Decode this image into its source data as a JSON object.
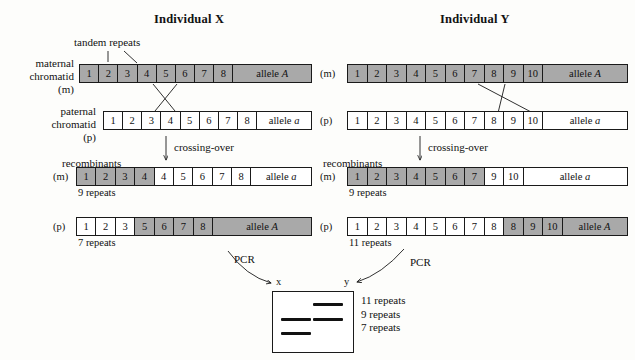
{
  "panels": [
    {
      "title": "Individual X",
      "annotations": {
        "tandem_repeats": "tandem repeats",
        "crossing_over": "crossing-over",
        "recombinants": "recombinants"
      },
      "maternal": {
        "label_lines": [
          "maternal",
          "chromatid",
          "(m)"
        ],
        "cells": [
          {
            "text": "1",
            "shaded": true
          },
          {
            "text": "2",
            "shaded": true
          },
          {
            "text": "3",
            "shaded": true
          },
          {
            "text": "4",
            "shaded": true
          },
          {
            "text": "5",
            "shaded": true
          },
          {
            "text": "6",
            "shaded": true
          },
          {
            "text": "7",
            "shaded": true
          },
          {
            "text": "8",
            "shaded": true
          }
        ],
        "allele": "allele A",
        "allele_symbol": "A",
        "allele_shaded": true
      },
      "paternal": {
        "label_lines": [
          "paternal",
          "chromatid",
          "(p)"
        ],
        "cells": [
          {
            "text": "1",
            "shaded": false
          },
          {
            "text": "2",
            "shaded": false
          },
          {
            "text": "3",
            "shaded": false
          },
          {
            "text": "4",
            "shaded": false
          },
          {
            "text": "5",
            "shaded": false
          },
          {
            "text": "6",
            "shaded": false
          },
          {
            "text": "7",
            "shaded": false
          },
          {
            "text": "8",
            "shaded": false
          }
        ],
        "allele": "allele a",
        "allele_symbol": "a",
        "allele_shaded": false
      },
      "recombinant_m": {
        "label": "(m)",
        "cells": [
          {
            "text": "1",
            "shaded": true
          },
          {
            "text": "2",
            "shaded": true
          },
          {
            "text": "3",
            "shaded": true
          },
          {
            "text": "4",
            "shaded": true
          },
          {
            "text": "4",
            "shaded": false
          },
          {
            "text": "5",
            "shaded": false
          },
          {
            "text": "6",
            "shaded": false
          },
          {
            "text": "7",
            "shaded": false
          },
          {
            "text": "8",
            "shaded": false
          }
        ],
        "allele": "allele a",
        "allele_symbol": "a",
        "allele_shaded": false,
        "repeats": "9 repeats"
      },
      "recombinant_p": {
        "label": "(p)",
        "cells": [
          {
            "text": "1",
            "shaded": false
          },
          {
            "text": "2",
            "shaded": false
          },
          {
            "text": "3",
            "shaded": false
          },
          {
            "text": "5",
            "shaded": true
          },
          {
            "text": "6",
            "shaded": true
          },
          {
            "text": "7",
            "shaded": true
          },
          {
            "text": "8",
            "shaded": true
          }
        ],
        "allele": "allele A",
        "allele_symbol": "A",
        "allele_shaded": true,
        "repeats": "7 repeats"
      }
    },
    {
      "title": "Individual Y",
      "annotations": {
        "crossing_over": "crossing-over",
        "recombinants": "recombinants"
      },
      "maternal": {
        "label_lines": [
          "(m)"
        ],
        "cells": [
          {
            "text": "1",
            "shaded": true
          },
          {
            "text": "2",
            "shaded": true
          },
          {
            "text": "3",
            "shaded": true
          },
          {
            "text": "4",
            "shaded": true
          },
          {
            "text": "5",
            "shaded": true
          },
          {
            "text": "6",
            "shaded": true
          },
          {
            "text": "7",
            "shaded": true
          },
          {
            "text": "8",
            "shaded": true
          },
          {
            "text": "9",
            "shaded": true
          },
          {
            "text": "10",
            "shaded": true
          }
        ],
        "allele": "allele A",
        "allele_symbol": "A",
        "allele_shaded": true
      },
      "paternal": {
        "label_lines": [
          "(p)"
        ],
        "cells": [
          {
            "text": "1",
            "shaded": false
          },
          {
            "text": "2",
            "shaded": false
          },
          {
            "text": "3",
            "shaded": false
          },
          {
            "text": "4",
            "shaded": false
          },
          {
            "text": "5",
            "shaded": false
          },
          {
            "text": "6",
            "shaded": false
          },
          {
            "text": "7",
            "shaded": false
          },
          {
            "text": "8",
            "shaded": false
          },
          {
            "text": "9",
            "shaded": false
          },
          {
            "text": "10",
            "shaded": false
          }
        ],
        "allele": "allele a",
        "allele_symbol": "a",
        "allele_shaded": false
      },
      "recombinant_m": {
        "label": "(m)",
        "cells": [
          {
            "text": "1",
            "shaded": true
          },
          {
            "text": "2",
            "shaded": true
          },
          {
            "text": "3",
            "shaded": true
          },
          {
            "text": "4",
            "shaded": true
          },
          {
            "text": "5",
            "shaded": true
          },
          {
            "text": "6",
            "shaded": true
          },
          {
            "text": "7",
            "shaded": true
          },
          {
            "text": "9",
            "shaded": false
          },
          {
            "text": "10",
            "shaded": false
          }
        ],
        "allele": "allele a",
        "allele_symbol": "a",
        "allele_shaded": false,
        "repeats": "9 repeats"
      },
      "recombinant_p": {
        "label": "(p)",
        "cells": [
          {
            "text": "1",
            "shaded": false
          },
          {
            "text": "2",
            "shaded": false
          },
          {
            "text": "3",
            "shaded": false
          },
          {
            "text": "4",
            "shaded": false
          },
          {
            "text": "5",
            "shaded": false
          },
          {
            "text": "6",
            "shaded": false
          },
          {
            "text": "7",
            "shaded": false
          },
          {
            "text": "8",
            "shaded": false
          },
          {
            "text": "8",
            "shaded": true
          },
          {
            "text": "9",
            "shaded": true
          },
          {
            "text": "10",
            "shaded": true
          }
        ],
        "allele": "allele A",
        "allele_symbol": "A",
        "allele_shaded": true,
        "repeats": "11 repeats"
      }
    }
  ],
  "gel": {
    "pcr_left_label": "PCR",
    "pcr_right_label": "PCR",
    "lane_x_label": "x",
    "lane_y_label": "y",
    "legend": [
      "11 repeats",
      "9 repeats",
      "7 repeats"
    ],
    "bands": [
      {
        "lane": "y",
        "row": 0,
        "size": "11 repeats"
      },
      {
        "lane": "x",
        "row": 1,
        "size": "9 repeats"
      },
      {
        "lane": "y",
        "row": 1,
        "size": "9 repeats"
      },
      {
        "lane": "x",
        "row": 2,
        "size": "7 repeats"
      }
    ]
  },
  "colors": {
    "shaded_cell": "#a9a9a9",
    "stroke": "#1a1a1a",
    "background": "#fdfdfb"
  }
}
